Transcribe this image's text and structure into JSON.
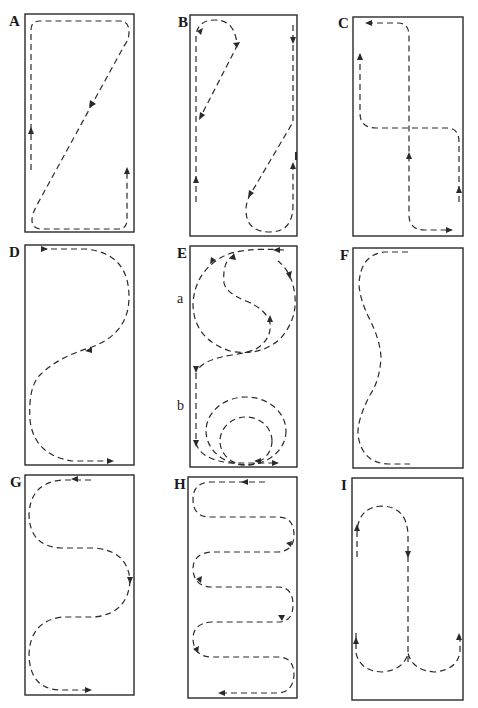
{
  "figure": {
    "panels": [
      {
        "id": "A",
        "label": "A",
        "pattern": "Z-shaped loop with diagonal return"
      },
      {
        "id": "B",
        "label": "B",
        "pattern": "Figure-eight with diagonal crossings and end loops"
      },
      {
        "id": "C",
        "label": "C",
        "pattern": "Interlocking right-angle loops crossing at center"
      },
      {
        "id": "D",
        "label": "D",
        "pattern": "Single S-curve from top left to bottom right"
      },
      {
        "id": "E",
        "label": "E",
        "pattern": "Circles and S-curves",
        "sub_labels": [
          {
            "id": "a",
            "label": "a"
          },
          {
            "id": "b",
            "label": "b"
          }
        ]
      },
      {
        "id": "F",
        "label": "F",
        "pattern": "Gentle serpentine along left side (no arrows)"
      },
      {
        "id": "G",
        "label": "G",
        "pattern": "Double S-curve (serpentine, 2 turns)"
      },
      {
        "id": "H",
        "label": "H",
        "pattern": "Tight serpentine / boustrophedon (6 passes)"
      },
      {
        "id": "I",
        "label": "I",
        "pattern": "Central line with loops at top and bottom"
      }
    ],
    "line_style": "dashed",
    "stroke_color": "#2a2a2a",
    "background": "#ffffff"
  }
}
